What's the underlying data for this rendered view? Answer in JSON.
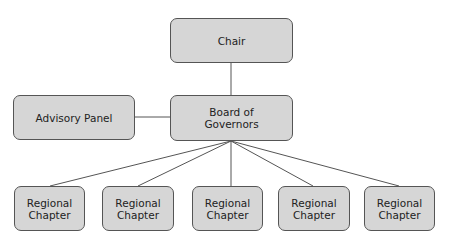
{
  "diagram": {
    "type": "org-chart",
    "nodes": [
      {
        "id": "chair",
        "label": "Chair"
      },
      {
        "id": "board",
        "label": "Board of\nGovernors"
      },
      {
        "id": "advisory",
        "label": "Advisory Panel"
      },
      {
        "id": "rc1",
        "label": "Regional\nChapter"
      },
      {
        "id": "rc2",
        "label": "Regional\nChapter"
      },
      {
        "id": "rc3",
        "label": "Regional\nChapter"
      },
      {
        "id": "rc4",
        "label": "Regional\nChapter"
      },
      {
        "id": "rc5",
        "label": "Regional\nChapter"
      }
    ],
    "edges": [
      [
        "chair",
        "board"
      ],
      [
        "advisory",
        "board"
      ],
      [
        "board",
        "rc1"
      ],
      [
        "board",
        "rc2"
      ],
      [
        "board",
        "rc3"
      ],
      [
        "board",
        "rc4"
      ],
      [
        "board",
        "rc5"
      ]
    ],
    "colors": {
      "node_fill": "#d6d6d6",
      "node_border": "#555555",
      "line": "#555555"
    }
  }
}
